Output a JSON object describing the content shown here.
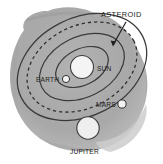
{
  "diagram": {
    "type": "astronomy-orbit-diagram",
    "background_color": "#ffffff",
    "disk_color": "#a9a9a9",
    "disk_edge_color": "#bdbdbd",
    "orbit_line_color": "#3a3a3a",
    "body_fill_color": "#f2f2f2",
    "body_stroke_color": "#333333",
    "label_color": "#1d1d1d",
    "labels": {
      "asteroid": "ASTEROID",
      "sun": "SUN",
      "earth": "EARTH",
      "mars": "MARS",
      "jupiter": "JUPITER"
    },
    "bodies": [
      {
        "name": "sun",
        "label": "SUN",
        "cx": 82,
        "cy": 67,
        "r": 11.5
      },
      {
        "name": "earth",
        "label": "EARTH",
        "cx": 66,
        "cy": 79,
        "r": 3.6
      },
      {
        "name": "mars",
        "label": "MARS",
        "cx": 122,
        "cy": 104,
        "r": 4.1
      },
      {
        "name": "jupiter",
        "label": "JUPITER",
        "cx": 88,
        "cy": 128,
        "r": 11.2
      }
    ],
    "orbits": [
      {
        "name": "earth-orbit",
        "rx": 28,
        "ry": 18,
        "style": "solid"
      },
      {
        "name": "mars-orbit",
        "rx": 45,
        "ry": 30,
        "style": "solid"
      },
      {
        "name": "asteroid-belt",
        "rx": 58,
        "ry": 41,
        "style": "dashed"
      },
      {
        "name": "jupiter-orbit",
        "rx": 68,
        "ry": 49,
        "style": "solid"
      }
    ],
    "orbit_center": {
      "cx": 82,
      "cy": 67
    },
    "orbit_rotation_deg": -27,
    "annotation": {
      "name": "asteroid-pointer",
      "text": "ASTEROID",
      "arrow_from": {
        "x": 126,
        "y": 22
      },
      "arrow_to": {
        "x": 112,
        "y": 46
      }
    }
  }
}
